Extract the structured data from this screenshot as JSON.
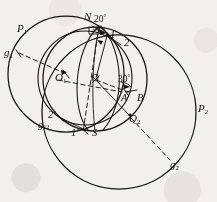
{
  "figure": {
    "kind": "stereographic-projection-diagram",
    "background_color": "#f2f0ed",
    "ink_color": "#16130f",
    "width": 217,
    "height": 202
  },
  "labels": {
    "pole_north": "N",
    "pole_south": "S",
    "angle_top": "20",
    "angle_top_unit": "°",
    "angle_right": "30",
    "angle_right_unit": "°",
    "point_1": "1",
    "point_2": "2",
    "point_1_prime": "1′",
    "point_2_prime": "2′",
    "point_A": "A",
    "point_B": "B",
    "center_O": "O",
    "center_O1": "O",
    "center_O1_sub": "1",
    "great_circle_P1": "P",
    "great_circle_P1_sub": "1",
    "great_circle_P2": "P",
    "great_circle_P2_sub": "2",
    "pole_g1": "g",
    "pole_g1_sub": "1",
    "pole_g2": "g",
    "pole_g2_sub": "2",
    "pole_g12": "g",
    "pole_g12_sub": "12",
    "point_Q2": "Q",
    "point_Q2_sub": "2"
  },
  "geometry": {
    "circles": [
      {
        "name": "primitive-circle-P1",
        "cx": 66,
        "cy": 74,
        "r": 58
      },
      {
        "name": "great-circle-P2",
        "cx": 119,
        "cy": 112,
        "r": 77
      },
      {
        "name": "projection-circle-main",
        "cx": 95,
        "cy": 79,
        "r": 52
      },
      {
        "name": "small-circle-left",
        "cx": 85,
        "cy": 78,
        "r": 47
      }
    ],
    "arcs": [
      {
        "name": "meridian-arc-left",
        "d": "M 98 25 C 74 48, 72 112, 89 131"
      },
      {
        "name": "meridian-arc-right",
        "d": "M 100 25 C 122 48, 124 106, 102 131"
      },
      {
        "name": "meridian-arc-center",
        "d": "M 99 25 C 92 52, 93 110, 95 131"
      }
    ],
    "dashed_lines": [
      {
        "name": "radius-O1-to-g1",
        "x1": 18,
        "y1": 53,
        "x2": 66,
        "y2": 74
      },
      {
        "name": "axis-N-to-S",
        "x1": 99,
        "y1": 25,
        "x2": 82,
        "y2": 133
      },
      {
        "name": "radius-O-to-A",
        "x1": 95,
        "y1": 79,
        "x2": 130,
        "y2": 92
      },
      {
        "name": "radius-Q2-to-g2",
        "x1": 130,
        "y1": 116,
        "x2": 172,
        "y2": 162
      },
      {
        "name": "diagonal-O1-to-O",
        "x1": 57,
        "y1": 79,
        "x2": 120,
        "y2": 91
      }
    ],
    "tick_points": [
      {
        "name": "tick-O1",
        "cx": 66,
        "cy": 74
      },
      {
        "name": "tick-O",
        "cx": 95,
        "cy": 79
      },
      {
        "name": "tick-A",
        "cx": 125,
        "cy": 91
      },
      {
        "name": "tick-Q2",
        "cx": 130,
        "cy": 116
      },
      {
        "name": "tick-1prime",
        "cx": 84,
        "cy": 131
      },
      {
        "name": "tick-1",
        "cx": 107,
        "cy": 35
      },
      {
        "name": "tick-2",
        "cx": 120,
        "cy": 44
      },
      {
        "name": "tick-2prime",
        "cx": 60,
        "cy": 117
      }
    ]
  }
}
